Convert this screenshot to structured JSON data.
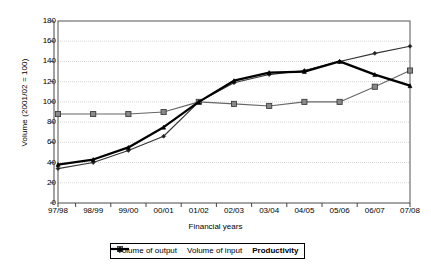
{
  "chart_data": {
    "type": "line",
    "title": "",
    "xlabel": "Financial years",
    "ylabel": "Volume (2001/02 = 100)",
    "categories": [
      "97/98",
      "98/99",
      "99/00",
      "00/01",
      "01/02",
      "02/03",
      "03/04",
      "04/05",
      "05/06",
      "06/07",
      "07/08"
    ],
    "ylim": [
      0,
      180
    ],
    "ytick_step": 20,
    "yticks": [
      180,
      160,
      140,
      120,
      100,
      80,
      60,
      40,
      20,
      0
    ],
    "grid": true,
    "legend_position": "bottom",
    "series": [
      {
        "name": "Volume of output",
        "values": [
          34,
          40,
          52,
          66,
          100,
          119,
          127,
          131,
          140,
          148,
          155
        ]
      },
      {
        "name": "Volume of input",
        "values": [
          88,
          88,
          88,
          90,
          100,
          98,
          96,
          100,
          100,
          115,
          131
        ]
      },
      {
        "name": "Productivity",
        "values": [
          38,
          43,
          55,
          75,
          100,
          121,
          129,
          130,
          140,
          127,
          116
        ]
      }
    ]
  },
  "axis": {
    "y_title": "Volume (2001/02 = 100)",
    "x_title": "Financial years"
  },
  "legend": {
    "items": [
      {
        "label": "Volume of output",
        "marker": "diamond-marker",
        "bold": false
      },
      {
        "label": "Volume of input",
        "marker": "square-marker",
        "bold": false
      },
      {
        "label": "Productivity",
        "marker": "triangle-marker",
        "bold": true
      }
    ]
  },
  "colors": {
    "output_line": "#333333",
    "input_line": "#666666",
    "productivity_line": "#000000",
    "grid": "#cccccc",
    "axis": "#555555",
    "marker_fill": "#888888"
  }
}
